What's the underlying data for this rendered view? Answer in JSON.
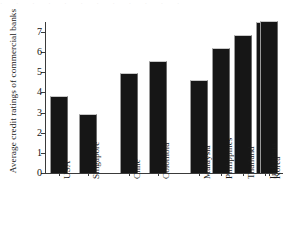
{
  "chart_data": {
    "type": "bar",
    "title": "",
    "xlabel": "",
    "ylabel": "Average credit ratings of commercial banks",
    "categories": [
      "USA",
      "Singapore",
      "Chile",
      "Colombia",
      "Malaysia",
      "Philippines",
      "Thailand",
      "Indonesia",
      "Korea"
    ],
    "values": [
      3.84,
      2.94,
      4.98,
      5.54,
      4.6,
      6.22,
      6.87,
      7.52,
      7.55
    ],
    "ylim": [
      0,
      7.5
    ],
    "yticks": [
      0,
      1,
      2,
      3,
      4,
      5,
      6,
      7
    ],
    "ytick_labels": [
      "0",
      "1",
      "2",
      "3",
      "4",
      "5",
      "6",
      "7"
    ],
    "groups": [
      {
        "name": "group-1",
        "categories": [
          "USA",
          "Singapore"
        ]
      },
      {
        "name": "group-2",
        "categories": [
          "Chile",
          "Colombia"
        ]
      },
      {
        "name": "group-3",
        "categories": [
          "Malaysia",
          "Philippines",
          "Thailand",
          "Indonesia",
          "Korea"
        ]
      }
    ],
    "grid": false,
    "legend": false,
    "bar_color": "#161616",
    "axis_color": "#3a3a3a",
    "background_color": "#ffffff"
  },
  "layout": {
    "bars": [
      {
        "label": "USA",
        "value": 3.84,
        "left": 5,
        "width": 18
      },
      {
        "label": "Singapore",
        "value": 2.94,
        "left": 34,
        "width": 18
      },
      {
        "label": "Chile",
        "value": 4.98,
        "left": 75,
        "width": 18
      },
      {
        "label": "Colombia",
        "value": 5.54,
        "left": 104,
        "width": 18
      },
      {
        "label": "Malaysia",
        "value": 4.6,
        "left": 145,
        "width": 18
      },
      {
        "label": "Philippines",
        "value": 6.22,
        "left": 167,
        "width": 18
      },
      {
        "label": "Thailand",
        "value": 6.87,
        "left": 189,
        "width": 18
      },
      {
        "label": "Indonesia",
        "value": 7.52,
        "left": 211,
        "width": 18
      },
      {
        "label": "Korea",
        "value": 7.55,
        "left": 215,
        "width": 18
      }
    ]
  },
  "artifact": {
    "top_sliver": "· · · · · · · · · · · ·"
  }
}
